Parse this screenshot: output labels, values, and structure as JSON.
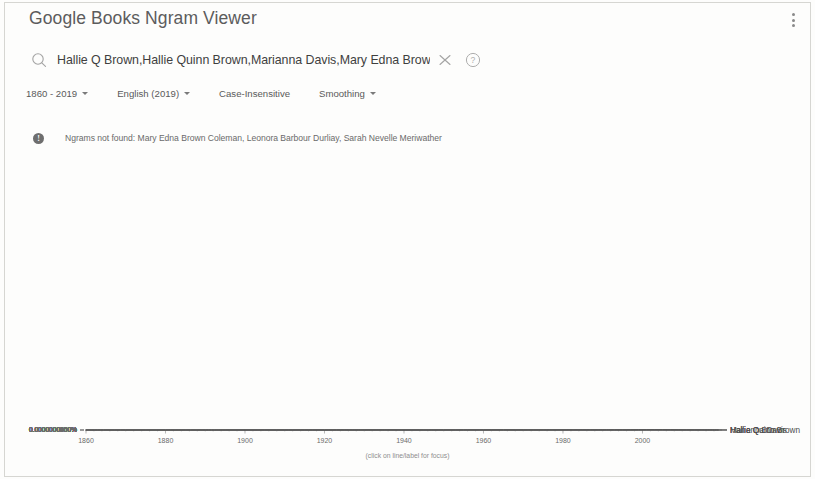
{
  "app": {
    "title": "Google Books Ngram Viewer",
    "menu_icon": "kebab-menu-icon"
  },
  "search": {
    "icon": "search-icon",
    "value": "Hallie Q Brown,Hallie Quinn Brown,Marianna Davis,Mary Edna Brown Coleman,Leo",
    "placeholder": "Search in Google Books Ngram Viewer",
    "clear_icon": "close-icon",
    "help_icon": "help-circle-icon"
  },
  "controls": {
    "years": "1860 - 2019",
    "corpus": "English (2019)",
    "case": "Case-Insensitive",
    "smoothing": "Smoothing"
  },
  "notice": {
    "icon": "info-icon",
    "text": "Ngrams not found: Mary Edna Brown Coleman, Leonora Barbour Durliay, Sarah Nevelle Meriwather"
  },
  "chart": {
    "focus_hint": "(click on line/label for focus)"
  },
  "chart_data": {
    "type": "line",
    "title": "Google Books Ngram Viewer",
    "xlabel": "",
    "ylabel": "",
    "xlim": [
      1860,
      2019
    ],
    "ylim": [
      0.0,
      6e-07
    ],
    "grid": false,
    "legend_position": "right-inline",
    "xticks": [
      1860,
      1880,
      1900,
      1920,
      1940,
      1960,
      1980,
      2000
    ],
    "yticks": [
      "0.0000000000%",
      "0.0000000050%",
      "0.0000000100%",
      "0.0000000150%",
      "0.0000000200%",
      "0.0000000250%",
      "0.0000000300%",
      "0.0000000350%",
      "0.0000000400%",
      "0.0000000450%",
      "0.0000000500%",
      "0.0000000550%",
      "0.0000000600%"
    ],
    "ytick_values": [
      0,
      5e-11,
      1e-10,
      1.5e-10,
      2e-10,
      2.5e-10,
      3e-10,
      3.5e-10,
      4e-10,
      4.5e-10,
      5e-10,
      5.5e-10,
      6e-10
    ],
    "series": [
      {
        "name": "Hallie Quinn Brown",
        "label_y_value": 1.05e-10,
        "x": [
          1860,
          1865,
          1870,
          1875,
          1880,
          1885,
          1890,
          1893,
          1896,
          1899,
          1902,
          1905,
          1908,
          1911,
          1914,
          1917,
          1920,
          1923,
          1926,
          1929,
          1932,
          1935,
          1938,
          1941,
          1944,
          1947,
          1950,
          1953,
          1956,
          1959,
          1962,
          1965,
          1968,
          1971,
          1974,
          1977,
          1980,
          1983,
          1985,
          1987,
          1989,
          1991,
          1993,
          1995,
          1997,
          1999,
          2001,
          2003,
          2005,
          2007,
          2009,
          2011,
          2013,
          2015,
          2017,
          2019
        ],
        "values": [
          0,
          0,
          0,
          0,
          0,
          0,
          1e-12,
          2e-12,
          5e-12,
          1.3e-11,
          2e-11,
          1.9e-11,
          2.3e-11,
          2.1e-11,
          2.4e-11,
          2.8e-11,
          3.6e-11,
          4.4e-11,
          4.8e-11,
          5.3e-11,
          5.6e-11,
          5.2e-11,
          4.4e-11,
          3.2e-11,
          2.4e-11,
          2.3e-11,
          2.6e-11,
          3.4e-11,
          4.6e-11,
          5e-11,
          4.4e-11,
          4e-11,
          4.3e-11,
          5.2e-11,
          6.6e-11,
          9e-11,
          1.3e-10,
          1.42e-10,
          1.36e-10,
          1.5e-10,
          1.2e-10,
          1.62e-10,
          1.82e-10,
          1.95e-10,
          2.5e-10,
          4.4e-10,
          5.3e-10,
          5.48e-10,
          5.3e-10,
          4.3e-10,
          2.6e-10,
          1.7e-10,
          1.35e-10,
          1.2e-10,
          1.12e-10,
          1.05e-10
        ]
      },
      {
        "name": "Marianna Davis",
        "label_y_value": 3.2e-11,
        "x": [
          1860,
          1870,
          1880,
          1890,
          1895,
          1900,
          1905,
          1910,
          1915,
          1920,
          1925,
          1930,
          1935,
          1940,
          1945,
          1950,
          1955,
          1960,
          1965,
          1970,
          1975,
          1978,
          1981,
          1984,
          1987,
          1990,
          1993,
          1996,
          1999,
          2002,
          2005,
          2008,
          2011,
          2014,
          2017,
          2019
        ],
        "values": [
          0,
          0,
          0,
          0,
          1e-12,
          2e-12,
          2e-12,
          3e-12,
          4e-12,
          5e-12,
          6e-12,
          7e-12,
          8e-12,
          9e-12,
          1e-11,
          1.4e-11,
          2.4e-11,
          4e-11,
          4.2e-11,
          4.6e-11,
          6.2e-11,
          5.2e-11,
          4.6e-11,
          5.2e-11,
          6.6e-11,
          7e-11,
          5.6e-11,
          6e-11,
          6.6e-11,
          8.6e-11,
          8.2e-11,
          4.8e-11,
          4.2e-11,
          3.8e-11,
          3.4e-11,
          3.2e-11
        ]
      },
      {
        "name": "Hallie Q Brown",
        "label_y_value": 2e-11,
        "x": [
          1860,
          1870,
          1880,
          1888,
          1892,
          1896,
          1900,
          1904,
          1908,
          1912,
          1916,
          1920,
          1924,
          1927,
          1929,
          1930,
          1931,
          1933,
          1935,
          1936,
          1937,
          1938,
          1939,
          1941,
          1945,
          1950,
          1955,
          1960,
          1965,
          1970,
          1975,
          1980,
          1985,
          1988,
          1990,
          1992,
          1995,
          1998,
          2001,
          2004,
          2007,
          2010,
          2013,
          2016,
          2019
        ],
        "values": [
          0,
          0,
          0,
          1e-12,
          4e-12,
          1.4e-11,
          1.8e-11,
          1.2e-11,
          1.4e-11,
          1.2e-11,
          1.4e-11,
          1.5e-11,
          1.6e-11,
          1.8e-11,
          2.4e-11,
          4.4e-11,
          4.4e-11,
          4.4e-11,
          4.4e-11,
          4.4e-11,
          4.4e-11,
          4.4e-11,
          1e-11,
          6e-12,
          5e-12,
          8e-12,
          1.6e-11,
          3.8e-11,
          4.2e-11,
          3.6e-11,
          3.2e-11,
          3.6e-11,
          6e-11,
          7.6e-11,
          4.4e-11,
          3.6e-11,
          3e-11,
          2.6e-11,
          2.2e-11,
          1.9e-11,
          1.8e-11,
          1.9e-11,
          2e-11,
          2e-11,
          2e-11
        ]
      }
    ]
  }
}
